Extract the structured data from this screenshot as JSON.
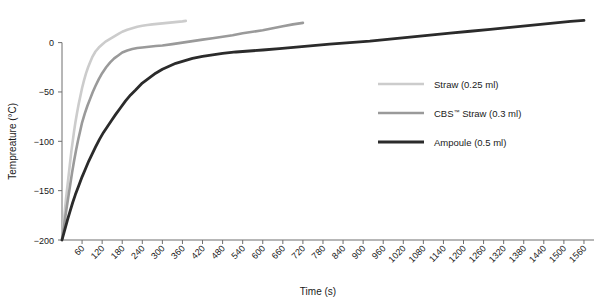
{
  "figure": {
    "background": "#ffffff",
    "width": 604,
    "height": 302
  },
  "axes": {
    "x_title": "Time (s)",
    "y_title": "Tempreature (°C)",
    "x_ticks": [
      60,
      120,
      180,
      240,
      300,
      360,
      420,
      480,
      540,
      600,
      660,
      720,
      780,
      840,
      900,
      960,
      1020,
      1080,
      1140,
      1200,
      1260,
      1320,
      1380,
      1440,
      1500,
      1560
    ],
    "y_ticks": [
      0,
      -50,
      -100,
      -150,
      -200
    ],
    "x_tick_labels": [
      "60",
      "120",
      "180",
      "240",
      "300",
      "360",
      "420",
      "480",
      "540",
      "600",
      "660",
      "720",
      "780",
      "840",
      "900",
      "960",
      "1020",
      "1080",
      "1140",
      "1200",
      "1260",
      "1320",
      "1380",
      "1440",
      "1500",
      "1560"
    ],
    "y_tick_labels": [
      "0",
      "−50",
      "−100",
      "−150",
      "−200"
    ],
    "axis_color": "#6e6e6e"
  },
  "legend": {
    "items": [
      {
        "label": "Straw (0.25 ml)",
        "color": "#cccccc",
        "width": 2.6
      },
      {
        "label_pre": "CBS",
        "label_sup": "™",
        "label_post": " Straw (0.3 ml)",
        "label": "CBS™ Straw (0.3 ml)",
        "color": "#9a9a9a",
        "width": 2.6
      },
      {
        "label": "Ampoule (0.5 ml)",
        "color": "#2b2b2b",
        "width": 2.8
      }
    ]
  },
  "chart_data": {
    "type": "line",
    "title": "",
    "xlabel": "Time (s)",
    "ylabel": "Tempreature (°C)",
    "xlim": [
      0,
      1590
    ],
    "ylim": [
      -200,
      30
    ],
    "grid": false,
    "legend_position": "center-right",
    "series": [
      {
        "name": "Straw (0.25 ml)",
        "color": "#cccccc",
        "x": [
          0,
          4,
          8,
          12,
          16,
          20,
          24,
          28,
          32,
          36,
          40,
          45,
          50,
          55,
          60,
          66,
          72,
          78,
          84,
          90,
          100,
          110,
          120,
          130,
          140,
          150,
          160,
          170,
          180,
          195,
          210,
          225,
          240,
          255,
          270,
          285,
          300,
          315,
          330,
          345,
          360,
          370
        ],
        "y": [
          -200,
          -186,
          -172,
          -158,
          -146,
          -134,
          -122,
          -110,
          -100,
          -90,
          -81,
          -71,
          -62,
          -54,
          -46,
          -38,
          -31,
          -25,
          -20,
          -15,
          -9,
          -5,
          -2,
          1,
          3,
          5,
          7,
          9,
          11,
          13,
          14.5,
          16,
          17,
          17.8,
          18.5,
          19,
          19.5,
          20,
          20.5,
          21,
          21.5,
          22
        ]
      },
      {
        "name": "CBS™ Straw (0.3 ml)",
        "color": "#9a9a9a",
        "x": [
          0,
          5,
          10,
          15,
          20,
          25,
          30,
          36,
          42,
          48,
          54,
          60,
          68,
          76,
          84,
          92,
          100,
          110,
          120,
          132,
          144,
          156,
          168,
          180,
          195,
          210,
          225,
          240,
          260,
          280,
          300,
          330,
          360,
          390,
          420,
          450,
          480,
          510,
          540,
          570,
          600,
          630,
          660,
          690,
          720
        ],
        "y": [
          -200,
          -188,
          -176,
          -165,
          -154,
          -143,
          -132,
          -120,
          -109,
          -99,
          -90,
          -81,
          -72,
          -64,
          -57,
          -50,
          -44,
          -37,
          -31,
          -25,
          -20,
          -16,
          -13,
          -10,
          -8,
          -6.5,
          -5.5,
          -5,
          -4.2,
          -3.5,
          -3,
          -1.5,
          0,
          1.5,
          3,
          4.5,
          6,
          7.5,
          9.5,
          11,
          12.5,
          14.5,
          16.5,
          18.5,
          20
        ]
      },
      {
        "name": "Ampoule (0.5 ml)",
        "color": "#2b2b2b",
        "x": [
          0,
          8,
          16,
          24,
          32,
          40,
          50,
          60,
          70,
          80,
          90,
          100,
          112,
          124,
          136,
          148,
          160,
          175,
          190,
          205,
          220,
          240,
          260,
          280,
          300,
          320,
          340,
          360,
          390,
          420,
          450,
          480,
          520,
          560,
          600,
          650,
          700,
          750,
          800,
          860,
          920,
          980,
          1040,
          1100,
          1160,
          1220,
          1280,
          1340,
          1400,
          1460,
          1520,
          1560
        ],
        "y": [
          -200,
          -190,
          -180,
          -171,
          -162,
          -154,
          -145,
          -136,
          -128,
          -120,
          -113,
          -106,
          -98,
          -91,
          -85,
          -79,
          -73,
          -66,
          -59,
          -53,
          -48,
          -41,
          -36,
          -31,
          -27,
          -24,
          -21,
          -19,
          -16,
          -14,
          -12.5,
          -11,
          -9.5,
          -8.5,
          -7.5,
          -6,
          -4.5,
          -3,
          -1.5,
          0,
          1.5,
          3.5,
          5.5,
          7.5,
          9.5,
          11.5,
          13.5,
          15.5,
          17.5,
          19.5,
          21.5,
          22.5
        ]
      }
    ]
  }
}
